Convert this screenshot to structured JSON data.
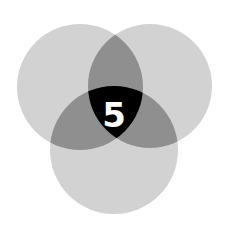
{
  "diagram": {
    "type": "venn",
    "sets": 3,
    "circles": [
      {
        "name": "top-left",
        "cx": 80,
        "cy": 87,
        "r": 63
      },
      {
        "name": "top-right",
        "cx": 150,
        "cy": 86,
        "r": 62
      },
      {
        "name": "bottom",
        "cx": 114,
        "cy": 150,
        "r": 64
      }
    ],
    "center_label": "5",
    "colors": {
      "single": "#d2d2d2",
      "double": "#8f8f8f",
      "triple": "#000000",
      "label": "#ffffff"
    }
  }
}
